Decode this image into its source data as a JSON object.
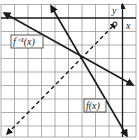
{
  "graph": {
    "axis_x_label": "x",
    "axis_y_label": "y",
    "f_label": "f(x)",
    "finv_label": "f⁻¹(x)",
    "line_color": "#1a1a1a",
    "grid_color": "#9a9a9a"
  }
}
